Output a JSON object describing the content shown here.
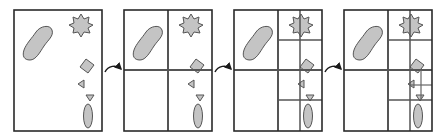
{
  "diagram": {
    "colors": {
      "frame": "#2a2a2a",
      "grid": "#555555",
      "shape_fill": "#c4c4c4",
      "shape_stroke": "#555555",
      "arrow": "#1a1a1a",
      "background": "#ffffff"
    },
    "frames": [
      {
        "name": "step-1-no-subdivision",
        "x": 14,
        "y": 10,
        "w": 88,
        "h": 121,
        "depth": 0
      },
      {
        "name": "step-2-one-level",
        "x": 124,
        "y": 10,
        "w": 88,
        "h": 121,
        "depth": 1
      },
      {
        "name": "step-3-two-levels",
        "x": 234,
        "y": 10,
        "w": 88,
        "h": 121,
        "depth": 2
      },
      {
        "name": "step-4-three-levels",
        "x": 344,
        "y": 10,
        "w": 88,
        "h": 121,
        "depth": 3
      }
    ],
    "shapes": [
      "blob",
      "star",
      "square",
      "triangle-left",
      "triangle-down",
      "ellipse"
    ],
    "arrows": [
      {
        "name": "arrow-1-to-2"
      },
      {
        "name": "arrow-2-to-3"
      },
      {
        "name": "arrow-3-to-4"
      }
    ]
  }
}
